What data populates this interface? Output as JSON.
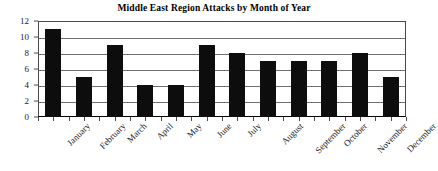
{
  "chart_data": {
    "type": "bar",
    "title": "Middle East Region Attacks by Month of Year",
    "xlabel": "",
    "ylabel": "",
    "categories": [
      "January",
      "February",
      "March",
      "April",
      "May",
      "June",
      "July",
      "August",
      "September",
      "October",
      "November",
      "December"
    ],
    "values": [
      11,
      5,
      9,
      4,
      4,
      9,
      8,
      7,
      7,
      7,
      8,
      5
    ],
    "series": [
      {
        "name": "Attacks",
        "values": [
          11,
          5,
          9,
          4,
          4,
          9,
          8,
          7,
          7,
          7,
          8,
          5
        ]
      }
    ],
    "ylim": [
      0,
      12
    ],
    "y_ticks": [
      0,
      2,
      4,
      6,
      8,
      10,
      12
    ],
    "y_tick_labels": [
      "0",
      "2",
      "4",
      "6",
      "8",
      "10",
      "12"
    ],
    "grid": true,
    "grid_axis": "y",
    "legend": false,
    "legend_position": "none",
    "bar_color": "#0d0d0d",
    "background_color": "#ffffff",
    "axis_color": "#4a4a4a",
    "gridline_color": "#6f6f6f",
    "x_tick_label_rotation": -45
  }
}
